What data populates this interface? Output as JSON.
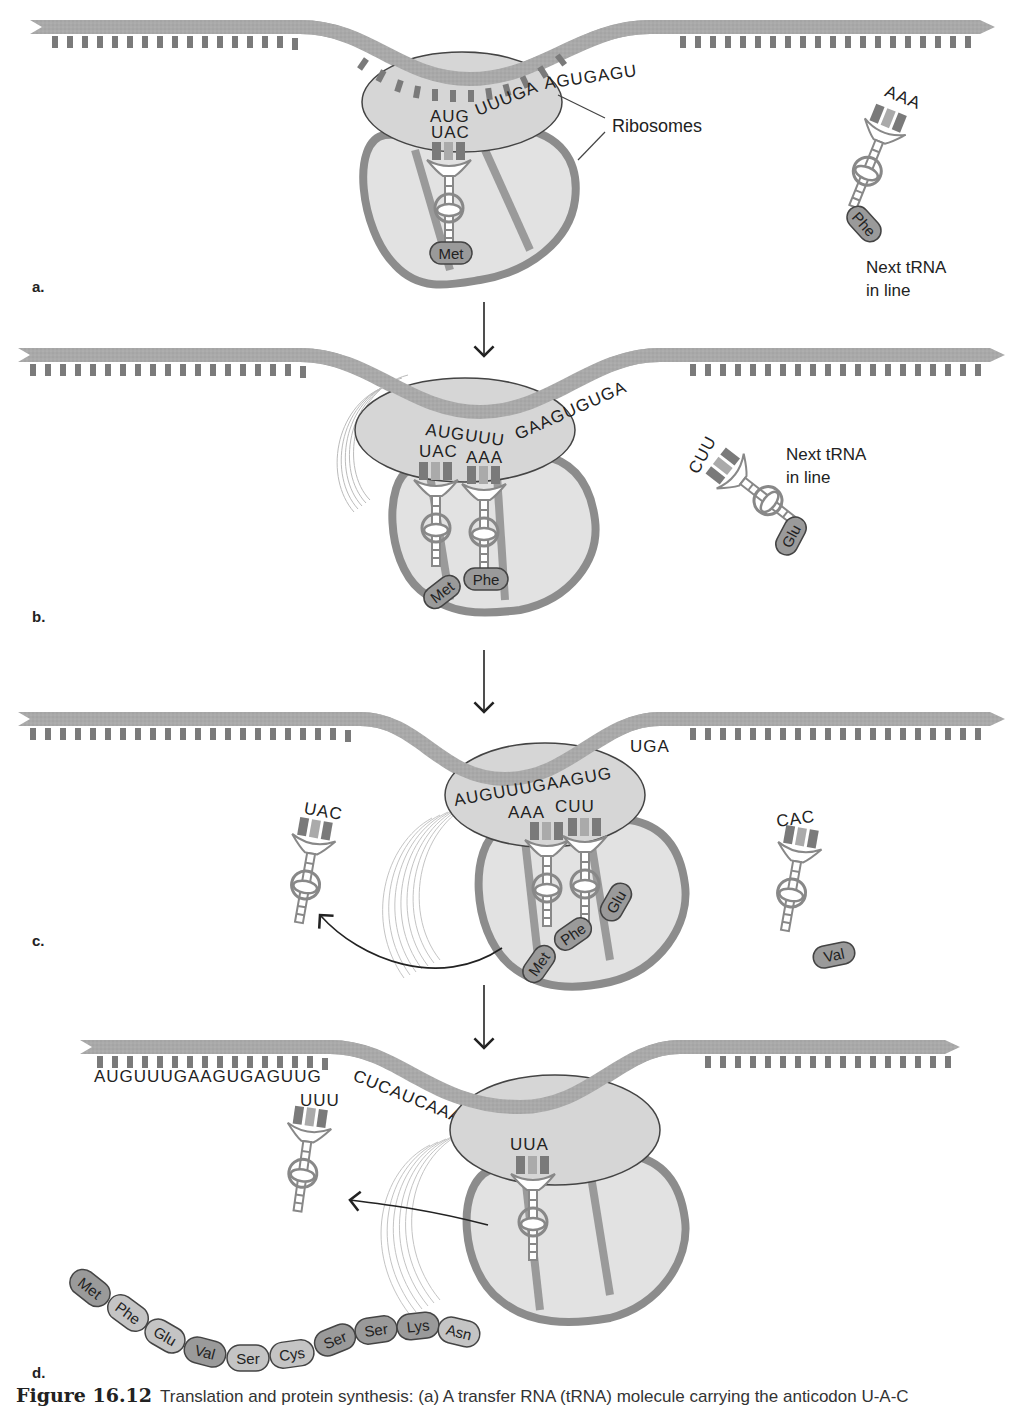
{
  "figure": {
    "number": "Figure 16.12",
    "caption": "Translation and protein synthesis: (a) A transfer RNA (tRNA) molecule carrying the anticodon U-A-C"
  },
  "colors": {
    "mrna_strand": "#a8a8a8",
    "base_dark": "#7a7a7a",
    "base_light": "#b8b8b8",
    "ribosome_fill": "#d6d6d6",
    "ribosome_body": "#e2e2e2",
    "ribosome_outline": "#8c8c8c",
    "amino_acid_fill": "#9a9a9a",
    "amino_acid_light": "#c4c4c4",
    "text": "#222222"
  },
  "panels": [
    {
      "letter": "a.",
      "mrna_codons": "AUGUUUGAAGUGAGU",
      "codon_bound": "AUG",
      "codon_rest": "UUUGA",
      "codon_tail": "AGUGAGU",
      "anticodons": [
        "UAC"
      ],
      "amino_acids_bound": [
        "Met"
      ],
      "ribosome_label": "Ribosomes",
      "next_trna": {
        "anticodon": "AAA",
        "amino_acid": "Phe",
        "label_line1": "Next tRNA",
        "label_line2": "in line"
      }
    },
    {
      "letter": "b.",
      "codon_a": "AUGUUU",
      "codon_b": "GAAGUGUGA",
      "anticodons": [
        "UAC",
        "AAA"
      ],
      "amino_acids_bound": [
        "Met",
        "Phe"
      ],
      "next_trna": {
        "anticodon": "CUU",
        "amino_acid": "Glu",
        "label_line1": "Next tRNA",
        "label_line2": "in line"
      }
    },
    {
      "letter": "c.",
      "codon_a": "AUGUUUGAAGUG",
      "codon_b": "UGA",
      "anticodons": [
        "AAA",
        "CUU"
      ],
      "amino_acids_bound": [
        "Met",
        "Phe",
        "Glu"
      ],
      "released_trna": {
        "anticodon": "UAC"
      },
      "next_trna": {
        "anticodon": "CAC",
        "amino_acid": "Val"
      }
    },
    {
      "letter": "d.",
      "mrna_left": "AUGUUUGAAGUGAGUUG",
      "mrna_curve": "CUCAUCAAAAA",
      "mrna_right": "UUGA",
      "anticodons": [
        "UUA"
      ],
      "released_trna": {
        "anticodon": "UUU"
      },
      "polypeptide": [
        "Met",
        "Phe",
        "Glu",
        "Val",
        "Ser",
        "Cys",
        "Ser",
        "Ser",
        "Lys",
        "Asn"
      ]
    }
  ]
}
